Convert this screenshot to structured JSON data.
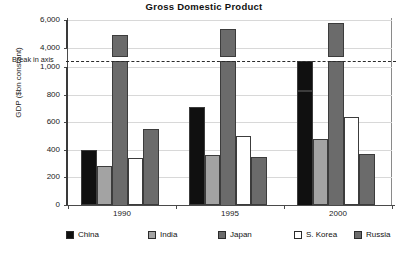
{
  "chart_data": {
    "type": "bar",
    "title": "Gross Domestic Product",
    "xlabel": "",
    "ylabel": "GDP ($bn constant)",
    "categories": [
      "1990",
      "1995",
      "2000"
    ],
    "series": [
      {
        "name": "China",
        "color": "#101010",
        "values": [
          400,
          710,
          1010
        ]
      },
      {
        "name": "India",
        "color": "#a3a3a3",
        "values": [
          280,
          360,
          480
        ]
      },
      {
        "name": "Japan",
        "color": "#6b6b6b",
        "values": [
          4900,
          5350,
          5800
        ]
      },
      {
        "name": "S. Korea",
        "color": "#ffffff",
        "values": [
          340,
          500,
          640
        ]
      },
      {
        "name": "Russia",
        "color": "#6b6b6b",
        "values": [
          550,
          350,
          370
        ]
      }
    ],
    "axis_break": {
      "label": "Break in axis",
      "lower_range": [
        0,
        1000
      ],
      "upper_range": [
        4000,
        6000
      ]
    },
    "yticks_lower": [
      "0",
      "200",
      "400",
      "600",
      "800",
      "1,000"
    ],
    "yticks_upper": [
      "4,000",
      "6,000"
    ],
    "ylim": [
      0,
      6000
    ],
    "grid": true,
    "legend_position": "bottom"
  },
  "legend": {
    "items": [
      {
        "label": "China",
        "color": "#101010"
      },
      {
        "label": "India",
        "color": "#a3a3a3"
      },
      {
        "label": "Japan",
        "color": "#6b6b6b"
      },
      {
        "label": "S. Korea",
        "color": "#ffffff"
      },
      {
        "label": "Russia",
        "color": "#6b6b6b"
      }
    ]
  }
}
